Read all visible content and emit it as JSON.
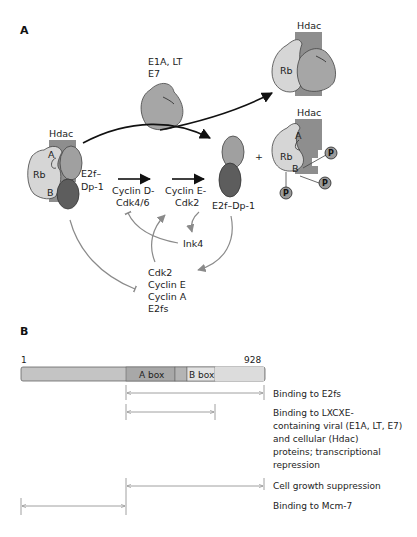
{
  "figure": {
    "panel_a_label": "A",
    "panel_b_label": "B"
  },
  "panel_a": {
    "viral_proteins": {
      "line1": "E1A, LT",
      "line2": "E7"
    },
    "left_complex": {
      "hdac": "Hdac",
      "rb": "Rb",
      "pocket_a": "A",
      "pocket_b": "B",
      "e2f_line1": "E2f–",
      "e2f_line2": "Dp-1"
    },
    "cyclin_d": {
      "line1": "Cyclin D-",
      "line2": "Cdk4/6"
    },
    "cyclin_e": {
      "line1": "Cyclin E-",
      "line2": "Cdk2"
    },
    "free_e2f": "E2f–Dp-1",
    "plus": "+",
    "ink4": "Ink4",
    "targets": [
      "Cdk2",
      "Cyclin E",
      "Cyclin A",
      "E2fs"
    ],
    "top_right_complex": {
      "hdac": "Hdac",
      "rb": "Rb"
    },
    "phospho_complex": {
      "hdac": "Hdac",
      "rb": "Rb",
      "pocket_a": "A",
      "pocket_b": "B",
      "phospho": "P"
    }
  },
  "panel_b": {
    "start": "1",
    "end": "928",
    "a_box": "A box",
    "b_box": "B box",
    "annotations": [
      {
        "label": "Binding to E2fs"
      },
      {
        "label_lines": [
          "Binding to LXCXE-",
          "containing viral (E1A, LT, E7)",
          "and cellular (Hdac)",
          "proteins; transcriptional",
          "repression"
        ]
      },
      {
        "label": "Cell growth suppression"
      },
      {
        "label": "Binding to Mcm-7"
      }
    ]
  },
  "colors": {
    "rb_light": "#d6d6d6",
    "hdac_gray": "#8e8e8e",
    "e2f_mid": "#9b9b9b",
    "dp1_dark": "#5d5d5d",
    "arrow_black": "#111111",
    "arrow_gray": "#8a8a8a",
    "bar_fill": "#c4c4c4",
    "abox_fill": "#a8a8a8",
    "bbox_fill": "#e2e2e2"
  }
}
